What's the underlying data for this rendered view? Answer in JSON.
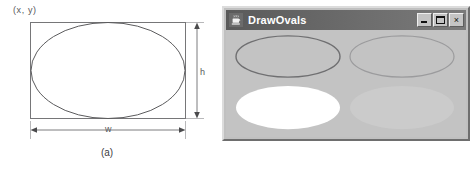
{
  "figure": {
    "panel_a": {
      "caption": "(a)",
      "origin_label": "(x, y)",
      "width_label": "w",
      "height_label": "h",
      "shape": "ellipse-in-bounding-rectangle"
    },
    "panel_b": {
      "caption": "(b)",
      "window": {
        "title": "DrawOvals",
        "icon": "java-coffee-cup-icon",
        "controls": {
          "minimize": "_",
          "maximize": "□",
          "close": "×"
        },
        "background_color": "#c3c3c3",
        "ovals": [
          {
            "name": "oval-top-left",
            "style": "outline",
            "stroke": "#6a6a6a",
            "fill": "none"
          },
          {
            "name": "oval-top-right",
            "style": "outline",
            "stroke": "#9a9a9a",
            "fill": "none"
          },
          {
            "name": "oval-bottom-left",
            "style": "filled",
            "stroke": "none",
            "fill": "#ffffff"
          },
          {
            "name": "oval-bottom-right",
            "style": "filled",
            "stroke": "none",
            "fill": "#cacaca"
          }
        ]
      }
    }
  }
}
